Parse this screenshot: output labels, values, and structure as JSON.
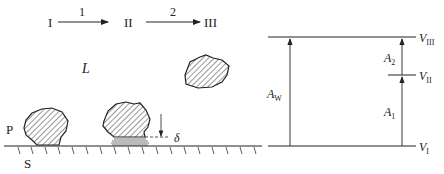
{
  "stages": {
    "s1": "I",
    "s2": "II",
    "s3": "III",
    "arrow1": "1",
    "arrow2": "2"
  },
  "labels": {
    "liquid": "L",
    "particle": "P",
    "surface": "S",
    "gap": "δ"
  },
  "energy": {
    "v3": "III",
    "v2": "II",
    "v1": "I",
    "v_base": "V",
    "a_base": "A",
    "aw_sub": "W",
    "a2_sub": "2",
    "a1_sub": "1"
  },
  "colors": {
    "ink": "#222222",
    "hatch": "#333333",
    "film": "#777777"
  }
}
